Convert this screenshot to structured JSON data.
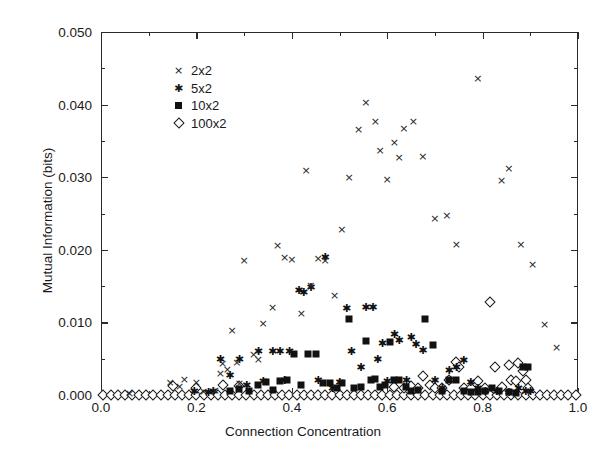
{
  "chart_data": {
    "type": "scatter",
    "title": "",
    "xlabel": "Connection Concentration",
    "ylabel": "Mutual Information (bits)",
    "xlim": [
      0.0,
      1.0
    ],
    "ylim": [
      0.0,
      0.05
    ],
    "xticks": [
      0.0,
      0.2,
      0.4,
      0.6,
      0.8,
      1.0
    ],
    "xticklabels": [
      "0.0",
      "0.2",
      "0.4",
      "0.6",
      "0.8",
      "1.0"
    ],
    "xminorticks": [
      0.1,
      0.3,
      0.5,
      0.7,
      0.9
    ],
    "yticks": [
      0.0,
      0.01,
      0.02,
      0.03,
      0.04,
      0.05
    ],
    "yticklabels": [
      "0.000",
      "0.010",
      "0.020",
      "0.030",
      "0.040",
      "0.050"
    ],
    "yminorticks": [
      0.005,
      0.015,
      0.025,
      0.035,
      0.045
    ],
    "grid": false,
    "legend_position": "upper left",
    "series": [
      {
        "name": "2x2",
        "marker": "cross-icon",
        "glyph": "×",
        "color": "#252525",
        "points": [
          [
            0.06,
            0.0003
          ],
          [
            0.145,
            0.0018
          ],
          [
            0.165,
            0.0012
          ],
          [
            0.175,
            0.0022
          ],
          [
            0.2,
            0.0018
          ],
          [
            0.215,
            0.0005
          ],
          [
            0.24,
            0.0007
          ],
          [
            0.25,
            0.003
          ],
          [
            0.255,
            0.0044
          ],
          [
            0.265,
            0.0036
          ],
          [
            0.275,
            0.009
          ],
          [
            0.285,
            0.0046
          ],
          [
            0.29,
            0.0017
          ],
          [
            0.3,
            0.0186
          ],
          [
            0.32,
            0.0057
          ],
          [
            0.33,
            0.005
          ],
          [
            0.34,
            0.0099
          ],
          [
            0.36,
            0.0121
          ],
          [
            0.37,
            0.0207
          ],
          [
            0.385,
            0.019
          ],
          [
            0.4,
            0.0188
          ],
          [
            0.42,
            0.0113
          ],
          [
            0.43,
            0.031
          ],
          [
            0.44,
            0.0152
          ],
          [
            0.455,
            0.0189
          ],
          [
            0.47,
            0.0186
          ],
          [
            0.49,
            0.0138
          ],
          [
            0.505,
            0.0228
          ],
          [
            0.52,
            0.03
          ],
          [
            0.54,
            0.0367
          ],
          [
            0.555,
            0.0404
          ],
          [
            0.575,
            0.0377
          ],
          [
            0.585,
            0.0338
          ],
          [
            0.6,
            0.0298
          ],
          [
            0.615,
            0.0349
          ],
          [
            0.625,
            0.0328
          ],
          [
            0.635,
            0.0368
          ],
          [
            0.655,
            0.0377
          ],
          [
            0.675,
            0.0329
          ],
          [
            0.7,
            0.0244
          ],
          [
            0.725,
            0.0248
          ],
          [
            0.745,
            0.0208
          ],
          [
            0.79,
            0.0436
          ],
          [
            0.84,
            0.0296
          ],
          [
            0.855,
            0.0312
          ],
          [
            0.88,
            0.0208
          ],
          [
            0.905,
            0.018
          ],
          [
            0.93,
            0.0098
          ],
          [
            0.955,
            0.0066
          ]
        ]
      },
      {
        "name": "5x2",
        "marker": "asterisk-icon",
        "glyph": "✳",
        "color": "#111111",
        "points": [
          [
            0.195,
            0.0005
          ],
          [
            0.225,
            0.0004
          ],
          [
            0.235,
            0.0006
          ],
          [
            0.25,
            0.005
          ],
          [
            0.27,
            0.0027
          ],
          [
            0.29,
            0.005
          ],
          [
            0.305,
            0.0014
          ],
          [
            0.33,
            0.006
          ],
          [
            0.34,
            0.0019
          ],
          [
            0.36,
            0.0061
          ],
          [
            0.375,
            0.0061
          ],
          [
            0.385,
            0.0021
          ],
          [
            0.395,
            0.006
          ],
          [
            0.415,
            0.0145
          ],
          [
            0.425,
            0.0142
          ],
          [
            0.44,
            0.0149
          ],
          [
            0.455,
            0.002
          ],
          [
            0.47,
            0.019
          ],
          [
            0.485,
            0.001
          ],
          [
            0.5,
            0.0018
          ],
          [
            0.515,
            0.012
          ],
          [
            0.525,
            0.006
          ],
          [
            0.545,
            0.0039
          ],
          [
            0.555,
            0.0121
          ],
          [
            0.57,
            0.0121
          ],
          [
            0.58,
            0.005
          ],
          [
            0.59,
            0.0072
          ],
          [
            0.6,
            0.0019
          ],
          [
            0.615,
            0.0084
          ],
          [
            0.625,
            0.0076
          ],
          [
            0.64,
            0.002
          ],
          [
            0.65,
            0.008
          ],
          [
            0.66,
            0.007
          ],
          [
            0.675,
            0.0062
          ],
          [
            0.7,
            0.002
          ],
          [
            0.715,
            0.0009
          ],
          [
            0.73,
            0.0034
          ],
          [
            0.745,
            0.0038
          ],
          [
            0.76,
            0.0048
          ],
          [
            0.775,
            0.0018
          ],
          [
            0.79,
            0.001
          ],
          [
            0.805,
            0.0005
          ],
          [
            0.83,
            0.0006
          ],
          [
            0.855,
            0.0004
          ],
          [
            0.875,
            0.0009
          ],
          [
            0.89,
            0.0006
          ],
          [
            0.9,
            0.0005
          ]
        ]
      },
      {
        "name": "10x2",
        "marker": "square-icon",
        "glyph": "■",
        "color": "#111111",
        "points": [
          [
            0.27,
            0.0006
          ],
          [
            0.29,
            0.0008
          ],
          [
            0.31,
            0.0005
          ],
          [
            0.33,
            0.0014
          ],
          [
            0.345,
            0.0018
          ],
          [
            0.36,
            0.0007
          ],
          [
            0.375,
            0.0019
          ],
          [
            0.39,
            0.002
          ],
          [
            0.405,
            0.0057
          ],
          [
            0.42,
            0.0014
          ],
          [
            0.435,
            0.0057
          ],
          [
            0.45,
            0.0056
          ],
          [
            0.465,
            0.0017
          ],
          [
            0.48,
            0.0016
          ],
          [
            0.495,
            0.0009
          ],
          [
            0.505,
            0.0016
          ],
          [
            0.52,
            0.0104
          ],
          [
            0.53,
            0.0009
          ],
          [
            0.545,
            0.0011
          ],
          [
            0.555,
            0.0074
          ],
          [
            0.565,
            0.002
          ],
          [
            0.575,
            0.0022
          ],
          [
            0.585,
            0.0011
          ],
          [
            0.595,
            0.0014
          ],
          [
            0.605,
            0.0073
          ],
          [
            0.615,
            0.0021
          ],
          [
            0.625,
            0.002
          ],
          [
            0.64,
            0.0011
          ],
          [
            0.65,
            0.0006
          ],
          [
            0.665,
            0.0007
          ],
          [
            0.68,
            0.0104
          ],
          [
            0.695,
            0.0069
          ],
          [
            0.715,
            0.0006
          ],
          [
            0.73,
            0.002
          ],
          [
            0.745,
            0.002
          ],
          [
            0.76,
            0.0005
          ],
          [
            0.775,
            0.0004
          ],
          [
            0.79,
            0.0004
          ],
          [
            0.805,
            0.0005
          ],
          [
            0.82,
            0.0009
          ],
          [
            0.835,
            0.0006
          ],
          [
            0.855,
            0.0004
          ],
          [
            0.87,
            0.0003
          ],
          [
            0.885,
            0.0038
          ],
          [
            0.895,
            0.0038
          ]
        ]
      },
      {
        "name": "100x2",
        "marker": "diamond-icon",
        "glyph": "◇",
        "color": "#1a1a1a",
        "points": [
          [
            0.005,
            0.0
          ],
          [
            0.02,
            0.0
          ],
          [
            0.035,
            0.0
          ],
          [
            0.05,
            0.0
          ],
          [
            0.065,
            0.0
          ],
          [
            0.08,
            0.0
          ],
          [
            0.095,
            0.0
          ],
          [
            0.11,
            0.0
          ],
          [
            0.125,
            0.0
          ],
          [
            0.14,
            0.0
          ],
          [
            0.155,
            0.0
          ],
          [
            0.17,
            0.0
          ],
          [
            0.185,
            0.0
          ],
          [
            0.2,
            0.0
          ],
          [
            0.215,
            0.0
          ],
          [
            0.23,
            0.0
          ],
          [
            0.245,
            0.0
          ],
          [
            0.26,
            0.0
          ],
          [
            0.275,
            0.0
          ],
          [
            0.29,
            0.0
          ],
          [
            0.305,
            0.0
          ],
          [
            0.32,
            0.0
          ],
          [
            0.335,
            0.0
          ],
          [
            0.35,
            0.0
          ],
          [
            0.365,
            0.0
          ],
          [
            0.38,
            0.0
          ],
          [
            0.395,
            0.0
          ],
          [
            0.41,
            0.0
          ],
          [
            0.425,
            0.0
          ],
          [
            0.44,
            0.0
          ],
          [
            0.455,
            0.0
          ],
          [
            0.47,
            0.0
          ],
          [
            0.485,
            0.0
          ],
          [
            0.5,
            0.0
          ],
          [
            0.515,
            0.0
          ],
          [
            0.53,
            0.0
          ],
          [
            0.545,
            0.0
          ],
          [
            0.56,
            0.0
          ],
          [
            0.575,
            0.0
          ],
          [
            0.59,
            0.0
          ],
          [
            0.605,
            0.0
          ],
          [
            0.62,
            0.0
          ],
          [
            0.635,
            0.0
          ],
          [
            0.65,
            0.0
          ],
          [
            0.665,
            0.0
          ],
          [
            0.68,
            0.0
          ],
          [
            0.695,
            0.0
          ],
          [
            0.71,
            0.0
          ],
          [
            0.725,
            0.0
          ],
          [
            0.74,
            0.0
          ],
          [
            0.755,
            0.0
          ],
          [
            0.77,
            0.0
          ],
          [
            0.785,
            0.0
          ],
          [
            0.8,
            0.0
          ],
          [
            0.815,
            0.0
          ],
          [
            0.83,
            0.0
          ],
          [
            0.845,
            0.0
          ],
          [
            0.86,
            0.0
          ],
          [
            0.875,
            0.0
          ],
          [
            0.89,
            0.0
          ],
          [
            0.905,
            0.0
          ],
          [
            0.92,
            0.0
          ],
          [
            0.935,
            0.0
          ],
          [
            0.95,
            0.0
          ],
          [
            0.965,
            0.0
          ],
          [
            0.98,
            0.0
          ],
          [
            0.995,
            0.0
          ],
          [
            0.15,
            0.0012
          ],
          [
            0.2,
            0.001
          ],
          [
            0.255,
            0.0014
          ],
          [
            0.29,
            0.0013
          ],
          [
            0.615,
            0.0011
          ],
          [
            0.635,
            0.001
          ],
          [
            0.65,
            0.0012
          ],
          [
            0.665,
            0.0009
          ],
          [
            0.675,
            0.0026
          ],
          [
            0.69,
            0.0014
          ],
          [
            0.7,
            0.0009
          ],
          [
            0.715,
            0.001
          ],
          [
            0.73,
            0.002
          ],
          [
            0.745,
            0.0046
          ],
          [
            0.75,
            0.0038
          ],
          [
            0.76,
            0.001
          ],
          [
            0.775,
            0.001
          ],
          [
            0.79,
            0.0019
          ],
          [
            0.805,
            0.0009
          ],
          [
            0.815,
            0.0128
          ],
          [
            0.825,
            0.0038
          ],
          [
            0.84,
            0.0011
          ],
          [
            0.855,
            0.0042
          ],
          [
            0.86,
            0.002
          ],
          [
            0.87,
            0.0019
          ],
          [
            0.875,
            0.0044
          ],
          [
            0.885,
            0.0033
          ],
          [
            0.89,
            0.002
          ],
          [
            0.895,
            0.0009
          ]
        ]
      }
    ]
  },
  "legend": {
    "entries": [
      {
        "label": "2x2",
        "glyph": "×"
      },
      {
        "label": "5x2",
        "glyph": "✳"
      },
      {
        "label": "10x2",
        "glyph": "■"
      },
      {
        "label": "100x2",
        "glyph": "◇"
      }
    ]
  }
}
